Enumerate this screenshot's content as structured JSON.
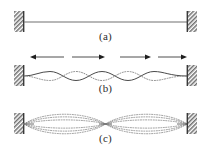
{
  "figure": {
    "width": 211,
    "height": 152,
    "background": "#ffffff",
    "ink_color": "#404040",
    "dotted_color": "#8a8a8a",
    "wall_hatch_color": "#6e6e6e"
  },
  "panels": [
    {
      "id": "a",
      "caption": "(a)",
      "description": "Straight string at rest clamped between two fixed walls",
      "string": {
        "style": "solid",
        "left_x": 24,
        "right_x": 187,
        "baseline_y": 22,
        "amplitude": 0
      },
      "supports": [
        {
          "name": "left-wall",
          "x": 14,
          "y": 11,
          "width": 10,
          "height": 21
        },
        {
          "name": "right-wall",
          "x": 187,
          "y": 11,
          "width": 10,
          "height": 21
        }
      ],
      "arrows": []
    },
    {
      "id": "b",
      "caption": "(b)",
      "description": "Two travelling waves of equal amplitude moving in opposite directions along the string",
      "string": {
        "style": "solid-plus-dotted",
        "left_x": 24,
        "right_x": 187,
        "baseline_y": 30,
        "amplitude": 7,
        "cycles": 2
      },
      "supports": [
        {
          "name": "left-wall",
          "x": 14,
          "y": 19,
          "width": 10,
          "height": 21
        },
        {
          "name": "right-wall",
          "x": 187,
          "y": 19,
          "width": 10,
          "height": 21
        }
      ],
      "arrows": [
        {
          "name": "arrow-1",
          "direction": "left",
          "x1": 32,
          "x2": 64,
          "y": 11
        },
        {
          "name": "arrow-2",
          "direction": "right",
          "x1": 72,
          "x2": 104,
          "y": 11
        },
        {
          "name": "arrow-3",
          "direction": "right",
          "x1": 120,
          "x2": 150,
          "y": 11
        },
        {
          "name": "arrow-4",
          "direction": "right",
          "x1": 158,
          "x2": 186,
          "y": 11
        }
      ]
    },
    {
      "id": "c",
      "caption": "(c)",
      "description": "Resulting standing wave shown as a family of dotted profiles with two antinode loops and a central node",
      "string": {
        "style": "dotted-envelope",
        "left_x": 24,
        "right_x": 187,
        "baseline_y": 26,
        "amplitude": 13,
        "cycles": 2,
        "profile_count": 6,
        "node_positions": [
          24,
          105.5,
          187
        ],
        "antinode_positions": [
          64.75,
          146.25
        ]
      },
      "supports": [
        {
          "name": "left-wall",
          "x": 14,
          "y": 15,
          "width": 10,
          "height": 21
        },
        {
          "name": "right-wall",
          "x": 187,
          "y": 15,
          "width": 10,
          "height": 21
        }
      ],
      "arrows": []
    }
  ]
}
